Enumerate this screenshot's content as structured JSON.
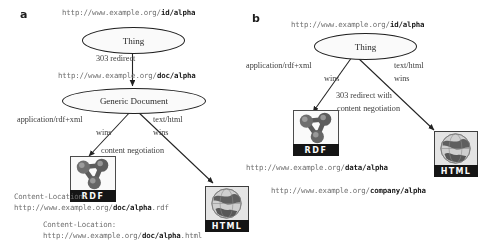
{
  "figure": {
    "panels": [
      {
        "id": "a",
        "label": "a",
        "nodes": {
          "thing": "Thing",
          "generic_document": "Generic Document"
        },
        "urls": {
          "id_alpha_prefix": "http://www.example.org/",
          "id_alpha_bold": "id/alpha",
          "doc_alpha_prefix": "http://www.example.org/",
          "doc_alpha_bold": "doc/alpha",
          "rdf_location_prefix": "http://www.example.org/",
          "rdf_location_bold": "doc/alpha",
          "rdf_location_suffix": ".rdf",
          "html_location_prefix": "http://www.example.org/",
          "html_location_bold": "doc/alpha",
          "html_location_suffix": ".html"
        },
        "edge_labels": {
          "redirect": "303 redirect",
          "rdf_conneg_line1": "application/rdf+xml",
          "rdf_conneg_line2": "wins",
          "html_conneg_line1": "text/html",
          "html_conneg_line2": "wins",
          "content_negotiation": "content negotiation"
        },
        "headers": {
          "content_location_rdf": "Content-Location:",
          "content_location_html": "Content-Location:"
        },
        "icons": {
          "rdf_label": "RDF",
          "html_label": "HTML"
        }
      },
      {
        "id": "b",
        "label": "b",
        "nodes": {
          "thing": "Thing"
        },
        "urls": {
          "id_alpha_prefix": "http://www.example.org/",
          "id_alpha_bold": "id/alpha",
          "data_alpha_prefix": "http://www.example.org/",
          "data_alpha_bold": "data/alpha",
          "company_alpha_prefix": "http://www.example.org/",
          "company_alpha_bold": "company/alpha"
        },
        "edge_labels": {
          "rdf_conneg_line1": "application/rdf+xml",
          "rdf_conneg_line2": "wins",
          "html_conneg_line1": "text/html",
          "html_conneg_line2": "wins",
          "redirect_line1": "303 redirect with",
          "redirect_line2": "content negotiation"
        },
        "icons": {
          "rdf_label": "RDF",
          "html_label": "HTML"
        }
      }
    ],
    "colors": {
      "background": "#ffffff",
      "stroke": "#1c1c1c",
      "url_text": "#6f6f6f",
      "url_bold": "#141414",
      "icon_bar": "#111111"
    }
  }
}
